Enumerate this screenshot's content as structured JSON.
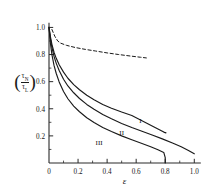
{
  "chart_data": {
    "type": "line",
    "title": "",
    "xlabel": "ε",
    "ylabel": "(τ_N / τ_L)",
    "ylabel_numerator": "τ",
    "ylabel_numerator_sub": "N",
    "ylabel_denominator": "τ",
    "ylabel_denominator_sub": "L",
    "xlim": [
      0,
      1.06
    ],
    "ylim": [
      0,
      1.04
    ],
    "xticks": [
      0,
      0.2,
      0.4,
      0.6,
      0.8,
      1.0
    ],
    "xticklabels": [
      "0",
      "0.2",
      "0.4",
      "0.6",
      "0.8",
      "1.0"
    ],
    "xminorticks": [
      0.1,
      0.3,
      0.5,
      0.7,
      0.9
    ],
    "yticks": [
      0.2,
      0.4,
      0.6,
      0.8,
      1.0
    ],
    "yticklabels": [
      "0.2",
      "0.4",
      "0.6",
      "0.8",
      "1.0"
    ],
    "yminorticks": [
      0.1,
      0.3,
      0.5,
      0.7,
      0.9
    ],
    "grid": false,
    "legend_position": "inline-curve-labels",
    "series": [
      {
        "name": "dashed-upper",
        "label": "",
        "style": "dashed",
        "points": [
          [
            0.02,
            0.985
          ],
          [
            0.04,
            0.935
          ],
          [
            0.06,
            0.9
          ],
          [
            0.08,
            0.884
          ],
          [
            0.12,
            0.868
          ],
          [
            0.18,
            0.852
          ],
          [
            0.25,
            0.838
          ],
          [
            0.32,
            0.826
          ],
          [
            0.4,
            0.812
          ],
          [
            0.48,
            0.8
          ],
          [
            0.56,
            0.789
          ],
          [
            0.63,
            0.78
          ],
          [
            0.67,
            0.775
          ]
        ]
      },
      {
        "name": "curve-I",
        "label": "I",
        "style": "solid",
        "label_x": 0.63,
        "label_y": 0.295,
        "points": [
          [
            0.0,
            1.0
          ],
          [
            0.01,
            0.93
          ],
          [
            0.02,
            0.875
          ],
          [
            0.035,
            0.815
          ],
          [
            0.05,
            0.772
          ],
          [
            0.07,
            0.725
          ],
          [
            0.1,
            0.67
          ],
          [
            0.13,
            0.625
          ],
          [
            0.17,
            0.578
          ],
          [
            0.21,
            0.54
          ],
          [
            0.26,
            0.5
          ],
          [
            0.31,
            0.466
          ],
          [
            0.37,
            0.432
          ],
          [
            0.43,
            0.404
          ],
          [
            0.5,
            0.376
          ],
          [
            0.57,
            0.35
          ],
          [
            0.63,
            0.318
          ],
          [
            0.68,
            0.29
          ],
          [
            0.72,
            0.268
          ],
          [
            0.76,
            0.245
          ],
          [
            0.79,
            0.228
          ],
          [
            0.805,
            0.222
          ]
        ]
      },
      {
        "name": "curve-II",
        "label": "II",
        "style": "solid",
        "label_x": 0.5,
        "label_y": 0.205,
        "points": [
          [
            0.0,
            1.0
          ],
          [
            0.01,
            0.915
          ],
          [
            0.02,
            0.852
          ],
          [
            0.035,
            0.785
          ],
          [
            0.05,
            0.735
          ],
          [
            0.07,
            0.682
          ],
          [
            0.1,
            0.618
          ],
          [
            0.13,
            0.568
          ],
          [
            0.17,
            0.518
          ],
          [
            0.21,
            0.476
          ],
          [
            0.26,
            0.432
          ],
          [
            0.31,
            0.396
          ],
          [
            0.37,
            0.358
          ],
          [
            0.43,
            0.326
          ],
          [
            0.5,
            0.292
          ],
          [
            0.57,
            0.262
          ],
          [
            0.64,
            0.234
          ],
          [
            0.71,
            0.206
          ],
          [
            0.78,
            0.178
          ],
          [
            0.85,
            0.148
          ],
          [
            0.91,
            0.12
          ],
          [
            0.96,
            0.092
          ],
          [
            1.0,
            0.068
          ]
        ]
      },
      {
        "name": "curve-III",
        "label": "III",
        "style": "solid",
        "label_x": 0.345,
        "label_y": 0.135,
        "points": [
          [
            0.0,
            1.0
          ],
          [
            0.01,
            0.88
          ],
          [
            0.02,
            0.8
          ],
          [
            0.035,
            0.718
          ],
          [
            0.05,
            0.66
          ],
          [
            0.07,
            0.598
          ],
          [
            0.1,
            0.528
          ],
          [
            0.13,
            0.474
          ],
          [
            0.17,
            0.42
          ],
          [
            0.21,
            0.378
          ],
          [
            0.26,
            0.334
          ],
          [
            0.31,
            0.298
          ],
          [
            0.37,
            0.262
          ],
          [
            0.43,
            0.232
          ],
          [
            0.5,
            0.2
          ],
          [
            0.57,
            0.172
          ],
          [
            0.64,
            0.144
          ],
          [
            0.7,
            0.12
          ],
          [
            0.75,
            0.098
          ],
          [
            0.79,
            0.078
          ],
          [
            0.8,
            0.04
          ],
          [
            0.8,
            0.0
          ]
        ]
      }
    ]
  },
  "colors": {
    "ink": "#1a1a1a",
    "axis": "#2a2a2a",
    "background": "#ffffff"
  }
}
